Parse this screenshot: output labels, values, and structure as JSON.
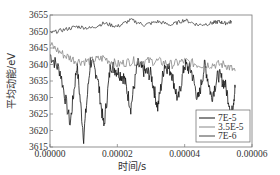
{
  "chart_data": {
    "type": "line",
    "title": "",
    "xlabel": "时间/s",
    "ylabel": "平均动能/eV",
    "xlim": [
      0,
      6e-05
    ],
    "ylim": [
      3615,
      3655
    ],
    "xticks": [
      "0.00000",
      "0.00002",
      "0.00004",
      "0.00006"
    ],
    "yticks": [
      "3615",
      "3620",
      "3625",
      "3630",
      "3635",
      "3640",
      "3645",
      "3650",
      "3655"
    ],
    "grid": false,
    "legend_position": "lower right",
    "series": [
      {
        "name": "7E-5",
        "color": "#111111",
        "x": [
          0,
          3e-06,
          6e-06,
          8e-06,
          1e-05,
          1.2e-05,
          1.4e-05,
          1.6e-05,
          1.8e-05,
          2e-05,
          2.2e-05,
          2.4e-05,
          2.6e-05,
          2.8e-05,
          3e-05,
          3.2e-05,
          3.4e-05,
          3.6e-05,
          3.8e-05,
          4e-05,
          4.2e-05,
          4.4e-05,
          4.6e-05,
          4.8e-05,
          5e-05,
          5.2e-05,
          5.4e-05,
          5.5e-05
        ],
        "values": [
          3643,
          3638,
          3622,
          3640,
          3618,
          3641,
          3637,
          3621,
          3640,
          3638,
          3636,
          3627,
          3640,
          3638,
          3637,
          3627,
          3640,
          3638,
          3629,
          3640,
          3638,
          3629,
          3640,
          3630,
          3637,
          3634,
          3625,
          3633
        ]
      },
      {
        "name": "3.5E-5",
        "color": "#888888",
        "x": [
          0,
          4e-06,
          8e-06,
          1.2e-05,
          1.6e-05,
          2e-05,
          2.4e-05,
          2.8e-05,
          3.2e-05,
          3.6e-05,
          4e-05,
          4.4e-05,
          4.8e-05,
          5.2e-05,
          5.5e-05
        ],
        "values": [
          3646,
          3643,
          3641,
          3641,
          3642,
          3640,
          3641,
          3641,
          3641,
          3640,
          3641,
          3640,
          3640,
          3640,
          3638
        ]
      },
      {
        "name": "7E-6",
        "color": "#444444",
        "x": [
          0,
          4e-06,
          8e-06,
          1.2e-05,
          1.6e-05,
          2e-05,
          2.4e-05,
          2.8e-05,
          3.2e-05,
          3.6e-05,
          4e-05,
          4.4e-05,
          4.8e-05,
          5e-05,
          5.2e-05,
          5.4e-05
        ],
        "values": [
          3649.5,
          3650.5,
          3651.5,
          3651,
          3652.5,
          3651.5,
          3653.5,
          3652,
          3653,
          3652,
          3653.5,
          3652,
          3652.5,
          3653,
          3652.5,
          3653
        ]
      }
    ]
  }
}
